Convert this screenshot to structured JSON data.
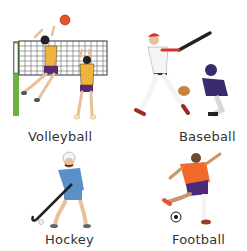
{
  "sports": [
    {
      "name": "Volleyball",
      "image": "volleyball-players-icon"
    },
    {
      "name": "Baseball",
      "image": "baseball-batter-catcher-icon"
    },
    {
      "name": "Hockey",
      "image": "hockey-player-icon"
    },
    {
      "name": "Football",
      "image": "football-player-icon"
    }
  ],
  "colors": {
    "label_text": "#333333",
    "volleyball_jersey": "#f2b33d",
    "volleyball_shorts": "#5a2a6e",
    "net_post": "#6db33f",
    "ball_orange": "#e8542a",
    "baseball_red": "#d8322e",
    "catcher_purple": "#3b2a6e",
    "hockey_blue": "#5a8fc8",
    "football_orange": "#f06a2c",
    "football_shorts": "#4b2a7a"
  }
}
